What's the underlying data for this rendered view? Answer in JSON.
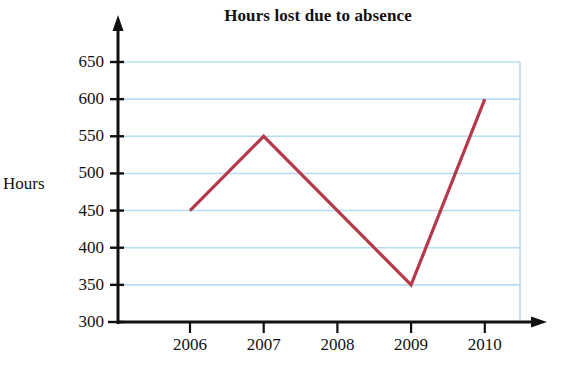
{
  "chart_data": {
    "type": "line",
    "title": "Hours lost due to absence",
    "xlabel": "",
    "ylabel": "Hours",
    "categories": [
      "2006",
      "2007",
      "2008",
      "2009",
      "2010"
    ],
    "values": [
      450,
      550,
      450,
      350,
      600
    ],
    "series": [
      {
        "name": "Hours lost",
        "values": [
          450,
          550,
          450,
          350,
          600
        ],
        "color": "#b5394a"
      }
    ],
    "ylim": [
      300,
      650
    ],
    "ytick_step": 50,
    "ytick_labels": [
      "300",
      "350",
      "400",
      "450",
      "500",
      "550",
      "600",
      "650"
    ],
    "xtick_labels": [
      "2006",
      "2007",
      "2008",
      "2009",
      "2010"
    ],
    "grid": "horizontal-plus-right-border",
    "grid_color": "#b8dcef",
    "axis_color": "#111111",
    "legend": "none",
    "axis_arrows": [
      "y-up",
      "x-right"
    ]
  },
  "axis": {
    "y_title": "Hours"
  }
}
